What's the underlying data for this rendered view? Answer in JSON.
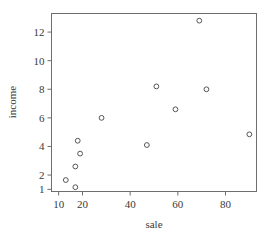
{
  "chart_data": {
    "type": "scatter",
    "title": "",
    "xlabel": "sale",
    "ylabel": "income",
    "xlim": [
      7,
      93
    ],
    "ylim": [
      0.85,
      13.3
    ],
    "xticks": [
      10,
      20,
      40,
      60,
      80
    ],
    "yticks": [
      1,
      2,
      4,
      6,
      8,
      10,
      12
    ],
    "grid": false,
    "legend": null,
    "marker": "open-circle",
    "marker_color": "#555555",
    "frame_color": "#6e6e6e",
    "points": [
      {
        "x": 13,
        "y": 1.65
      },
      {
        "x": 17,
        "y": 1.15
      },
      {
        "x": 17,
        "y": 2.6
      },
      {
        "x": 18,
        "y": 4.4
      },
      {
        "x": 19,
        "y": 3.5
      },
      {
        "x": 28,
        "y": 6.0
      },
      {
        "x": 47,
        "y": 4.1
      },
      {
        "x": 51,
        "y": 8.2
      },
      {
        "x": 59,
        "y": 6.6
      },
      {
        "x": 69,
        "y": 12.8
      },
      {
        "x": 72,
        "y": 8.0
      },
      {
        "x": 90,
        "y": 4.85
      }
    ],
    "x": [
      13,
      17,
      17,
      18,
      19,
      28,
      47,
      51,
      59,
      69,
      72,
      90
    ],
    "y": [
      1.65,
      1.15,
      2.6,
      4.4,
      3.5,
      6.0,
      4.1,
      8.2,
      6.6,
      12.8,
      8.0,
      4.85
    ]
  }
}
